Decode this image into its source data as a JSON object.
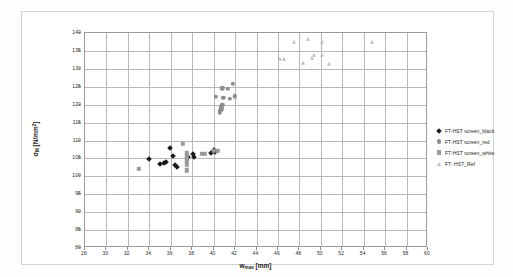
{
  "chart_data": {
    "type": "scatter",
    "title": "",
    "xlabel": "w_max [mm]",
    "ylabel": "σ_M [N/mm²]",
    "xlim": [
      28,
      60
    ],
    "ylim": [
      80,
      140
    ],
    "xticks": [
      28,
      30,
      32,
      34,
      36,
      38,
      40,
      42,
      44,
      46,
      48,
      50,
      52,
      54,
      56,
      58,
      60
    ],
    "yticks": [
      80,
      85,
      90,
      95,
      100,
      105,
      110,
      115,
      120,
      125,
      130,
      135,
      140
    ],
    "xtick_labels": [
      "28",
      "30",
      "32",
      "34",
      "36",
      "38",
      "40",
      "42",
      "44",
      "46",
      "48",
      "50",
      "52",
      "54",
      "56",
      "58",
      "60"
    ],
    "ytick_labels": [
      "80",
      "85",
      "90",
      "95",
      "100",
      "105",
      "110",
      "115",
      "120",
      "125",
      "130",
      "135",
      "140"
    ],
    "grid": true,
    "legend_position": "right",
    "series": [
      {
        "name": "FT-HST screen_black",
        "marker": "diamond",
        "color": "#1a1a1a",
        "points": [
          [
            34.0,
            104.7
          ],
          [
            35.0,
            103.5
          ],
          [
            35.4,
            103.7
          ],
          [
            35.6,
            104.1
          ],
          [
            35.9,
            107.9
          ],
          [
            36.2,
            105.8
          ],
          [
            36.4,
            103.2
          ],
          [
            36.6,
            102.5
          ],
          [
            37.6,
            105.3
          ],
          [
            38.1,
            106.2
          ],
          [
            38.2,
            105.5
          ],
          [
            39.8,
            106.6
          ],
          [
            40.0,
            107.4
          ],
          [
            40.1,
            106.8
          ]
        ]
      },
      {
        "name": "FT-HST screen_red",
        "marker": "circle",
        "color": "#8c8c8c",
        "points": [
          [
            40.2,
            122.2
          ],
          [
            40.6,
            118.1
          ],
          [
            40.6,
            117.7
          ],
          [
            40.7,
            118.6
          ],
          [
            40.7,
            119.3
          ],
          [
            40.8,
            120.0
          ],
          [
            40.8,
            124.6
          ],
          [
            40.9,
            122.0
          ],
          [
            41.3,
            124.4
          ],
          [
            41.5,
            121.7
          ],
          [
            41.8,
            125.9
          ],
          [
            42.0,
            122.3
          ]
        ]
      },
      {
        "name": "FT-HST screen_white",
        "marker": "square",
        "color": "#9a9a9a",
        "points": [
          [
            33.0,
            102.1
          ],
          [
            37.1,
            109.0
          ],
          [
            37.5,
            106.5
          ],
          [
            37.5,
            105.8
          ],
          [
            37.5,
            104.9
          ],
          [
            37.5,
            104.2
          ],
          [
            37.5,
            103.2
          ],
          [
            37.5,
            101.7
          ],
          [
            38.9,
            106.3
          ],
          [
            39.2,
            106.3
          ],
          [
            40.0,
            107.2
          ],
          [
            40.4,
            107.2
          ]
        ]
      },
      {
        "name": "FT- HST_Ref",
        "marker": "triangle",
        "color": "#bfbfbf",
        "points": [
          [
            46.2,
            132.8
          ],
          [
            46.6,
            132.7
          ],
          [
            47.5,
            137.6
          ],
          [
            48.3,
            131.5
          ],
          [
            48.8,
            138.3
          ],
          [
            49.2,
            133.1
          ],
          [
            49.4,
            133.8
          ],
          [
            50.1,
            133.9
          ],
          [
            50.1,
            137.6
          ],
          [
            50.8,
            131.3
          ],
          [
            54.8,
            137.5
          ]
        ]
      }
    ]
  },
  "legend": {
    "items": [
      {
        "label": "FT-HST screen_black",
        "marker": "diamond"
      },
      {
        "label": "FT-HST screen_red",
        "marker": "circle"
      },
      {
        "label": "FT-HST screen_white",
        "marker": "square"
      },
      {
        "label": "FT- HST_Ref",
        "marker": "triangle"
      }
    ]
  },
  "axis_titles": {
    "x_main": "w",
    "x_sub": "max",
    "x_unit": " [mm]",
    "y_main": "σ",
    "y_sub": "M",
    "y_unit": " [N/mm",
    "y_sup": "2",
    "y_close": "]"
  }
}
